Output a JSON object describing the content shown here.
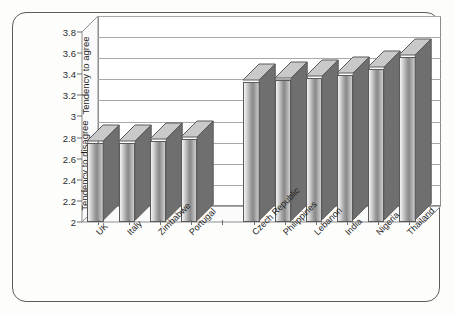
{
  "chart_data": {
    "type": "bar",
    "title": "",
    "subtitle": "",
    "xlabel": "",
    "ylabel": "Tendency to agree / Tendency to disagree",
    "ylabel_upper": "Tendency to agree",
    "ylabel_lower": "Tendency to disagree",
    "ylim": [
      2,
      3.8
    ],
    "ytick_labels": [
      "2",
      "2.2",
      "2.4",
      "2.6",
      "2.8",
      "3",
      "3.2",
      "3.4",
      "3.6",
      "3.8"
    ],
    "ytick_values": [
      2,
      2.2,
      2.4,
      2.6,
      2.8,
      3,
      3.2,
      3.4,
      3.6,
      3.8
    ],
    "grid": true,
    "legend": false,
    "legend_position": "none",
    "style": "3d-column",
    "categories": [
      "UK",
      "Italy",
      "Zimbabwe",
      "Portugal",
      "",
      "Czech Republic",
      "Philippines",
      "Lebanon",
      "India",
      "Nigeria",
      "Thailand"
    ],
    "values": [
      2.75,
      2.75,
      2.77,
      2.79,
      null,
      3.33,
      3.35,
      3.36,
      3.39,
      3.45,
      3.56
    ],
    "series": [
      {
        "name": "Tendency",
        "values": [
          2.75,
          2.75,
          2.77,
          2.79,
          null,
          3.33,
          3.35,
          3.36,
          3.39,
          3.45,
          3.56
        ]
      }
    ],
    "annotations": []
  },
  "axis": {
    "y_ticks": [
      {
        "label": "3.8",
        "value": 3.8
      },
      {
        "label": "3.6",
        "value": 3.6
      },
      {
        "label": "3.4",
        "value": 3.4
      },
      {
        "label": "3.2",
        "value": 3.2
      },
      {
        "label": "3",
        "value": 3
      },
      {
        "label": "2.8",
        "value": 2.8
      },
      {
        "label": "2.6",
        "value": 2.6
      },
      {
        "label": "2.4",
        "value": 2.4
      },
      {
        "label": "2.2",
        "value": 2.2
      },
      {
        "label": "2",
        "value": 2
      }
    ],
    "label_agree": "Tendency to agree",
    "label_disagree": "Tendency to disagree"
  },
  "colors": {
    "frame_border": "#5c5c5c",
    "plot_background": "#ffffff",
    "gridline": "#a8a8a8",
    "bar_light": "#e8e8e8",
    "bar_dark": "#8a8a8a",
    "bar_outline": "#5a5a5a",
    "bar_side": "#6f6f6f",
    "bar_top": "#c9c9c9",
    "text": "#1d1d1d",
    "page_background": "#fdfdfc"
  }
}
